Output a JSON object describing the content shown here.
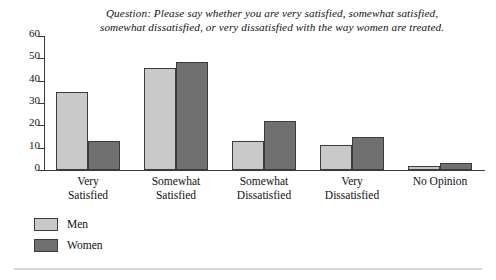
{
  "chart_data": {
    "type": "bar",
    "title": "Question: Please say whether you are very satisfied, somewhat satisfied, somewhat dissatisfied, or very dissatisfied with the way women are treated.",
    "title_lines": [
      "Question: Please say whether you are very satisfied, somewhat satisfied,",
      "somewhat dissatisfied, or very dissatisfied with the way women are treated."
    ],
    "xlabel": "",
    "ylabel": "",
    "ylim": [
      0,
      60
    ],
    "yticks": [
      0,
      10,
      20,
      30,
      40,
      50,
      60
    ],
    "ytick_labels": [
      "0",
      "10",
      "20",
      "30",
      "40",
      "50",
      "60"
    ],
    "grid": false,
    "legend_position": "bottom-left",
    "categories": [
      "Very Satisfied",
      "Somewhat Satisfied",
      "Somewhat Dissatisfied",
      "Very Dissatisfied",
      "No Opinion"
    ],
    "category_lines": [
      [
        "Very",
        "Satisfied"
      ],
      [
        "Somewhat",
        "Satisfied"
      ],
      [
        "Somewhat",
        "Dissatisfied"
      ],
      [
        "Very",
        "Dissatisfied"
      ],
      [
        "No Opinion"
      ]
    ],
    "series": [
      {
        "name": "Men",
        "color": "#c9c9c9",
        "values": [
          35,
          45.5,
          13,
          11,
          2
        ]
      },
      {
        "name": "Women",
        "color": "#6f6f6f",
        "values": [
          13,
          48.5,
          22,
          15,
          3
        ]
      }
    ]
  },
  "legend": {
    "items": [
      {
        "label": "Men",
        "color": "#c9c9c9"
      },
      {
        "label": "Women",
        "color": "#6f6f6f"
      }
    ]
  },
  "colors": {
    "men": "#c9c9c9",
    "women": "#6f6f6f",
    "axis": "#3a3a3a",
    "bar_outline": "#3b3b3b",
    "rule": "#d8d8d8",
    "background": "#ffffff"
  }
}
